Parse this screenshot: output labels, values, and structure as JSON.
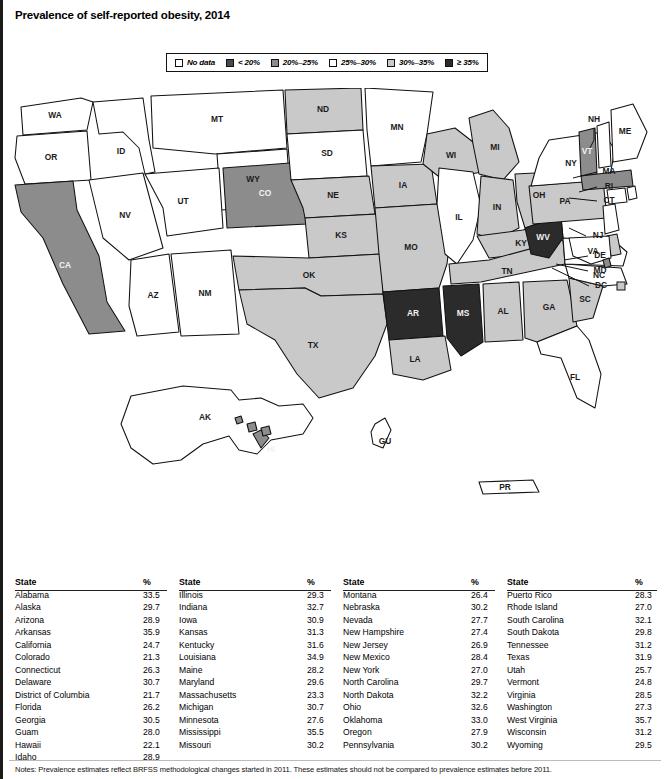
{
  "title": "Prevalence of self-reported obesity, 2014",
  "legend": {
    "items": [
      {
        "label": "No data",
        "color": "#ffffff",
        "name": "legend-no-data"
      },
      {
        "label": "< 20%",
        "color": "#4a4a4a",
        "name": "legend-under-20"
      },
      {
        "label": "20%–25%",
        "color": "#8c8c8c",
        "name": "legend-20-25"
      },
      {
        "label": "25%–30%",
        "color": "#ffffff",
        "name": "legend-25-30"
      },
      {
        "label": "30%–35%",
        "color": "#c9c9c9",
        "name": "legend-30-35"
      },
      {
        "label": "≥ 35%",
        "color": "#2b2b2b",
        "name": "legend-35-plus"
      }
    ]
  },
  "colors": {
    "no_data": "#ffffff",
    "under20": "#4a4a4a",
    "b20_25": "#8c8c8c",
    "b25_30": "#ffffff",
    "b30_35": "#c9c9c9",
    "b35plus": "#2b2b2b",
    "outline": "#111111"
  },
  "map": {
    "labels": {
      "WA": "WA",
      "OR": "OR",
      "ID": "ID",
      "MT": "MT",
      "WY": "WY",
      "NV": "NV",
      "UT": "UT",
      "CA": "CA",
      "AZ": "AZ",
      "NM": "NM",
      "CO": "CO",
      "ND": "ND",
      "SD": "SD",
      "NE": "NE",
      "KS": "KS",
      "OK": "OK",
      "TX": "TX",
      "MN": "MN",
      "IA": "IA",
      "MO": "MO",
      "AR": "AR",
      "LA": "LA",
      "WI": "WI",
      "IL": "IL",
      "MI": "MI",
      "IN": "IN",
      "OH": "OH",
      "KY": "KY",
      "TN": "TN",
      "MS": "MS",
      "AL": "AL",
      "GA": "GA",
      "FL": "FL",
      "SC": "SC",
      "NC": "NC",
      "VA": "VA",
      "WV": "WV",
      "PA": "PA",
      "NY": "NY",
      "VT": "VT",
      "NH": "NH",
      "ME": "ME",
      "MA": "MA",
      "RI": "RI",
      "CT": "CT",
      "NJ": "NJ",
      "DE": "DE",
      "MD": "MD",
      "DC": "DC",
      "AK": "AK",
      "HI": "HI",
      "GU": "GU",
      "PR": "PR"
    }
  },
  "chart_data": {
    "type": "map",
    "title": "Prevalence of self-reported obesity, 2014",
    "unit": "%",
    "bins": [
      "No data",
      "< 20%",
      "20%–25%",
      "25%–30%",
      "30%–35%",
      "≥ 35%"
    ],
    "values": {
      "Alabama": 33.5,
      "Alaska": 29.7,
      "Arizona": 28.9,
      "Arkansas": 35.9,
      "California": 24.7,
      "Colorado": 21.3,
      "Connecticut": 26.3,
      "Delaware": 30.7,
      "District of Columbia": 21.7,
      "Florida": 26.2,
      "Georgia": 30.5,
      "Guam": 28.0,
      "Hawaii": 22.1,
      "Idaho": 28.9,
      "Illinois": 29.3,
      "Indiana": 32.7,
      "Iowa": 30.9,
      "Kansas": 31.3,
      "Kentucky": 31.6,
      "Louisiana": 34.9,
      "Maine": 28.2,
      "Maryland": 29.6,
      "Massachusetts": 23.3,
      "Michigan": 30.7,
      "Minnesota": 27.6,
      "Mississippi": 35.5,
      "Missouri": 30.2,
      "Montana": 26.4,
      "Nebraska": 30.2,
      "Nevada": 27.7,
      "New Hampshire": 27.4,
      "New Jersey": 26.9,
      "New Mexico": 28.4,
      "New York": 27.0,
      "North Carolina": 29.7,
      "North Dakota": 32.2,
      "Ohio": 32.6,
      "Oklahoma": 33.0,
      "Oregon": 27.9,
      "Pennsylvania": 30.2,
      "Puerto Rico": 28.3,
      "Rhode Island": 27.0,
      "South Carolina": 32.1,
      "South Dakota": 29.8,
      "Tennessee": 31.2,
      "Texas": 31.9,
      "Utah": 25.7,
      "Vermont": 24.8,
      "Virginia": 28.5,
      "Washington": 27.3,
      "West Virginia": 35.7,
      "Wisconsin": 31.2,
      "Wyoming": 29.5
    }
  },
  "table": {
    "headers": {
      "state": "State",
      "pct": "%"
    },
    "columns": [
      [
        {
          "state": "Alabama",
          "pct": "33.5"
        },
        {
          "state": "Alaska",
          "pct": "29.7"
        },
        {
          "state": "Arizona",
          "pct": "28.9"
        },
        {
          "state": "Arkansas",
          "pct": "35.9"
        },
        {
          "state": "California",
          "pct": "24.7"
        },
        {
          "state": "Colorado",
          "pct": "21.3"
        },
        {
          "state": "Connecticut",
          "pct": "26.3"
        },
        {
          "state": "Delaware",
          "pct": "30.7"
        },
        {
          "state": "District of Columbia",
          "pct": "21.7"
        },
        {
          "state": "Florida",
          "pct": "26.2"
        },
        {
          "state": "Georgia",
          "pct": "30.5"
        },
        {
          "state": "Guam",
          "pct": "28.0"
        },
        {
          "state": "Hawaii",
          "pct": "22.1"
        },
        {
          "state": "Idaho",
          "pct": "28.9"
        }
      ],
      [
        {
          "state": "Illinois",
          "pct": "29.3"
        },
        {
          "state": "Indiana",
          "pct": "32.7"
        },
        {
          "state": "Iowa",
          "pct": "30.9"
        },
        {
          "state": "Kansas",
          "pct": "31.3"
        },
        {
          "state": "Kentucky",
          "pct": "31.6"
        },
        {
          "state": "Louisiana",
          "pct": "34.9"
        },
        {
          "state": "Maine",
          "pct": "28.2"
        },
        {
          "state": "Maryland",
          "pct": "29.6"
        },
        {
          "state": "Massachusetts",
          "pct": "23.3"
        },
        {
          "state": "Michigan",
          "pct": "30.7"
        },
        {
          "state": "Minnesota",
          "pct": "27.6"
        },
        {
          "state": "Mississippi",
          "pct": "35.5"
        },
        {
          "state": "Missouri",
          "pct": "30.2"
        }
      ],
      [
        {
          "state": "Montana",
          "pct": "26.4"
        },
        {
          "state": "Nebraska",
          "pct": "30.2"
        },
        {
          "state": "Nevada",
          "pct": "27.7"
        },
        {
          "state": "New Hampshire",
          "pct": "27.4"
        },
        {
          "state": "New Jersey",
          "pct": "26.9"
        },
        {
          "state": "New Mexico",
          "pct": "28.4"
        },
        {
          "state": "New York",
          "pct": "27.0"
        },
        {
          "state": "North Carolina",
          "pct": "29.7"
        },
        {
          "state": "North Dakota",
          "pct": "32.2"
        },
        {
          "state": "Ohio",
          "pct": "32.6"
        },
        {
          "state": "Oklahoma",
          "pct": "33.0"
        },
        {
          "state": "Oregon",
          "pct": "27.9"
        },
        {
          "state": "Pennsylvania",
          "pct": "30.2"
        }
      ],
      [
        {
          "state": "Puerto Rico",
          "pct": "28.3"
        },
        {
          "state": "Rhode Island",
          "pct": "27.0"
        },
        {
          "state": "South Carolina",
          "pct": "32.1"
        },
        {
          "state": "South Dakota",
          "pct": "29.8"
        },
        {
          "state": "Tennessee",
          "pct": "31.2"
        },
        {
          "state": "Texas",
          "pct": "31.9"
        },
        {
          "state": "Utah",
          "pct": "25.7"
        },
        {
          "state": "Vermont",
          "pct": "24.8"
        },
        {
          "state": "Virginia",
          "pct": "28.5"
        },
        {
          "state": "Washington",
          "pct": "27.3"
        },
        {
          "state": "West Virginia",
          "pct": "35.7"
        },
        {
          "state": "Wisconsin",
          "pct": "31.2"
        },
        {
          "state": "Wyoming",
          "pct": "29.5"
        }
      ]
    ]
  },
  "notes": "Notes: Prevalence estimates reflect BRFSS methodological changes started in 2011. These estimates should not be compared to prevalence estimates before 2011."
}
